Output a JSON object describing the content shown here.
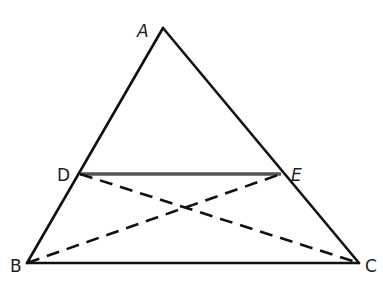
{
  "diagram": {
    "type": "geometry",
    "colors": {
      "line": "#111111",
      "midsegment": "#555555",
      "label": "#222222",
      "background": "#ffffff"
    },
    "points": {
      "A": {
        "label": "A",
        "x": 163,
        "y": 28
      },
      "B": {
        "label": "B",
        "x": 27,
        "y": 263
      },
      "C": {
        "label": "C",
        "x": 359,
        "y": 263
      },
      "D": {
        "label": "D",
        "x": 80,
        "y": 174
      },
      "E": {
        "label": "E",
        "x": 281,
        "y": 174
      }
    },
    "segments": [
      {
        "name": "AB",
        "from": "A",
        "to": "B",
        "style": "solid"
      },
      {
        "name": "AC",
        "from": "A",
        "to": "C",
        "style": "solid"
      },
      {
        "name": "BC",
        "from": "B",
        "to": "C",
        "style": "solid"
      },
      {
        "name": "DE",
        "from": "D",
        "to": "E",
        "style": "solid-thick-gray"
      },
      {
        "name": "BE",
        "from": "B",
        "to": "E",
        "style": "dashed"
      },
      {
        "name": "DC",
        "from": "D",
        "to": "C",
        "style": "dashed"
      }
    ]
  }
}
